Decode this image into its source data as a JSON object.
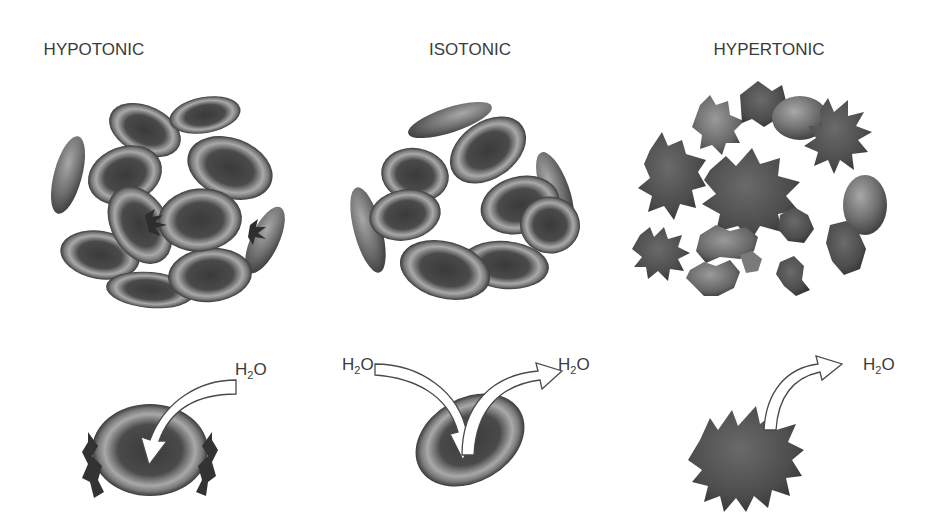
{
  "diagram": {
    "panels": [
      {
        "id": "hypotonic",
        "label": "HYPOTONIC",
        "cluster": "swollen, some cells bursting (lysed)",
        "single_cell": "swollen cell rupturing at sides",
        "arrows": [
          {
            "direction": "in",
            "label_main": "H",
            "label_sub": "2",
            "label_end": "O"
          }
        ]
      },
      {
        "id": "isotonic",
        "label": "ISOTONIC",
        "cluster": "normal biconcave disc cells",
        "single_cell": "normal biconcave disc",
        "arrows": [
          {
            "direction": "in",
            "label_main": "H",
            "label_sub": "2",
            "label_end": "O"
          },
          {
            "direction": "out",
            "label_main": "H",
            "label_sub": "2",
            "label_end": "O"
          }
        ]
      },
      {
        "id": "hypertonic",
        "label": "HYPERTONIC",
        "cluster": "shrunken, crenated (spiky) cells",
        "single_cell": "crenated shrunken cell",
        "arrows": [
          {
            "direction": "out",
            "label_main": "H",
            "label_sub": "2",
            "label_end": "O"
          }
        ]
      }
    ],
    "colors": {
      "background": "#ffffff",
      "text": "#3b3b3b",
      "cell_dark": "#3c3c3c",
      "cell_mid": "#6e6e6e",
      "cell_light": "#b8b8b8",
      "arrow_fill": "#ffffff",
      "arrow_stroke": "#4a4a4a"
    }
  }
}
